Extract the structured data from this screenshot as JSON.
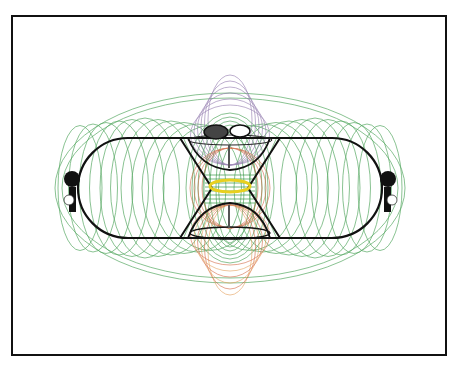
{
  "diagram": {
    "type": "magnetic field line illustration",
    "frame": {
      "left": 11,
      "top": 15,
      "right": 447,
      "bottom": 356
    },
    "colors": {
      "border": "#111111",
      "circuit": "#111111",
      "field_green": "#3a9a48",
      "field_purple": "#8a70a8",
      "field_red": "#d0603a",
      "field_orange": "#e39a50",
      "ring_yellow": "#e8d020"
    },
    "circuit": {
      "racetrack": {
        "x_left": 78,
        "x_right": 382,
        "y_top": 138,
        "y_bottom": 238
      },
      "center_x": 230,
      "hourglass": {
        "top_y": 138,
        "waist_y": 188,
        "bottom_y": 238
      }
    },
    "components": [
      {
        "name": "left-battery",
        "x": 72,
        "y": 185
      },
      {
        "name": "right-battery",
        "x": 388,
        "y": 185
      },
      {
        "name": "top-left-coil",
        "x": 215,
        "y": 130
      },
      {
        "name": "top-right-coil",
        "x": 240,
        "y": 130
      },
      {
        "name": "center-ring",
        "x": 230,
        "y": 186
      }
    ]
  }
}
